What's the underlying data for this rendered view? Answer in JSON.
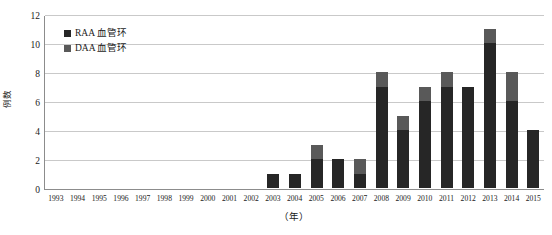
{
  "chart_data": {
    "type": "bar",
    "subtype": "stacked-column",
    "title": "",
    "xlabel": "（年）",
    "ylabel": "例数",
    "ylim": [
      0,
      12
    ],
    "ytick_step": 2,
    "yticks": [
      "12",
      "10",
      "8",
      "6",
      "4",
      "2",
      "0"
    ],
    "grid": true,
    "legend_position": "top-left-inside",
    "categories": [
      "1993",
      "1994",
      "1995",
      "1996",
      "1997",
      "1998",
      "1999",
      "2000",
      "2001",
      "2002",
      "2003",
      "2004",
      "2005",
      "2006",
      "2007",
      "2008",
      "2009",
      "2010",
      "2011",
      "2012",
      "2013",
      "2014",
      "2015"
    ],
    "series": [
      {
        "name": "RAA 血管环",
        "color": "#262626",
        "values": [
          0,
          0,
          0,
          0,
          0,
          0,
          0,
          0,
          0,
          0,
          1,
          1,
          2,
          2,
          1,
          7,
          4,
          6,
          7,
          7,
          10,
          6,
          4
        ]
      },
      {
        "name": "DAA 血管环",
        "color": "#595959",
        "values": [
          0,
          0,
          0,
          0,
          0,
          0,
          0,
          0,
          0,
          0,
          0,
          0,
          1,
          0,
          1,
          1,
          1,
          1,
          1,
          0,
          1,
          2,
          0
        ]
      }
    ],
    "totals": [
      0,
      0,
      0,
      0,
      0,
      0,
      0,
      0,
      0,
      0,
      1,
      1,
      3,
      2,
      2,
      8,
      5,
      7,
      8,
      7,
      11,
      8,
      4
    ]
  },
  "legend": {
    "items": [
      {
        "label": "RAA 血管环",
        "swatch_name": "legend-swatch-raa"
      },
      {
        "label": "DAA 血管环",
        "swatch_name": "legend-swatch-daa"
      }
    ]
  },
  "colors": {
    "raa": "#262626",
    "daa": "#595959",
    "gridline": "#c9c9c9",
    "axis": "#8c8c8c",
    "background": "#ffffff",
    "text": "#1a1a1a"
  }
}
